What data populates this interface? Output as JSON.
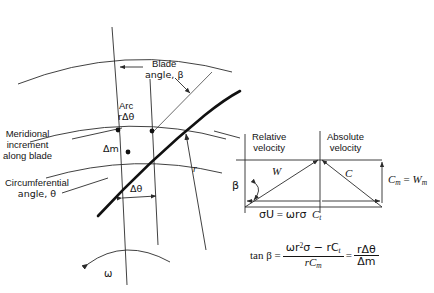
{
  "figure": {
    "stroke_color": "#2b2b2b",
    "blade_color": "#111111",
    "text_color": "#141414"
  },
  "main_diagram": {
    "labels": {
      "blade_angle_line1": "Blade",
      "blade_angle_line2": "angle, β",
      "arc_line1": "Arc",
      "arc_line2": "rΔθ",
      "meridional_line1": "Meridional",
      "meridional_line2": "increment",
      "meridional_line3": "along blade",
      "delta_m": "Δm",
      "circumferential_line1": "Circumferential",
      "circumferential_line2": "angle, θ",
      "delta_theta": "Δθ",
      "radius": "r",
      "omega": "ω"
    }
  },
  "velocity_triangle": {
    "headers": {
      "relative_line1": "Relative",
      "relative_line2": "velocity",
      "absolute_line1": "Absolute",
      "absolute_line2": "velocity"
    },
    "labels": {
      "beta": "β",
      "W": "W",
      "C": "C",
      "Cm_eq_Wm": "C",
      "Cm_sub": "m",
      "Wm_main": "W",
      "Wm_sub": "m",
      "base_U": "σU",
      "base_eq": "=",
      "base_omega_r": "ωrσ",
      "base_Ct_main": "C",
      "base_Ct_sub": "t"
    }
  },
  "equation": {
    "lhs": "tan β =",
    "numerator_a": "ωr",
    "numerator_sup": "2",
    "numerator_b": "σ − rC",
    "numerator_sub": "t",
    "denominator_a": "rC",
    "denominator_sub": "m",
    "equals": "=",
    "frac2_num": "rΔθ",
    "frac2_den": "Δm"
  }
}
